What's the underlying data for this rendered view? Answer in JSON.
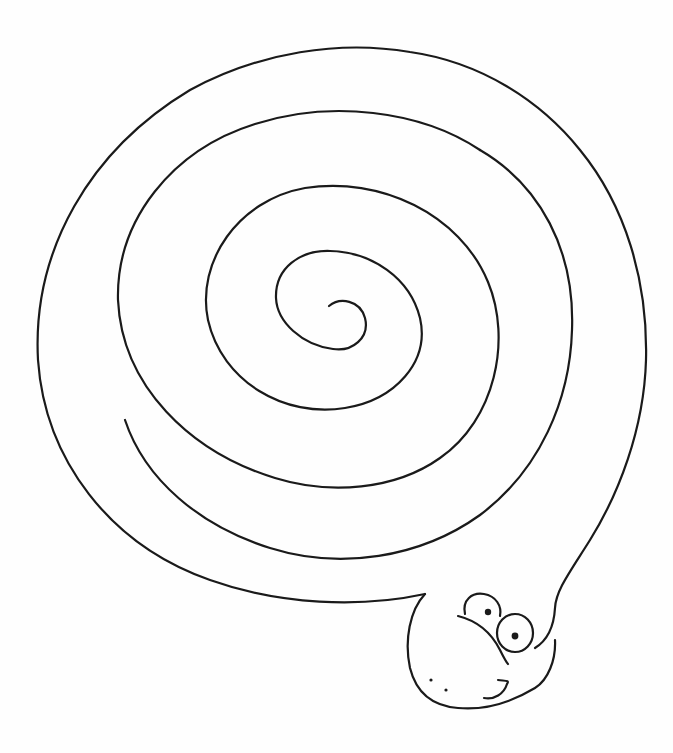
{
  "page": {
    "type": "coloring-page",
    "subject": "spiral coiled snake",
    "background_color": "#ffffff",
    "line_color": "#1a1a1a"
  },
  "illustration": {
    "name": "snake",
    "parts": [
      {
        "id": "spiral-body",
        "label": "Coiled spiral body"
      },
      {
        "id": "head",
        "label": "Snake head"
      },
      {
        "id": "eye-left",
        "label": "Left eye"
      },
      {
        "id": "eye-right",
        "label": "Right eye"
      },
      {
        "id": "nostrils",
        "label": "Nostrils"
      },
      {
        "id": "smile",
        "label": "Smile"
      }
    ]
  }
}
